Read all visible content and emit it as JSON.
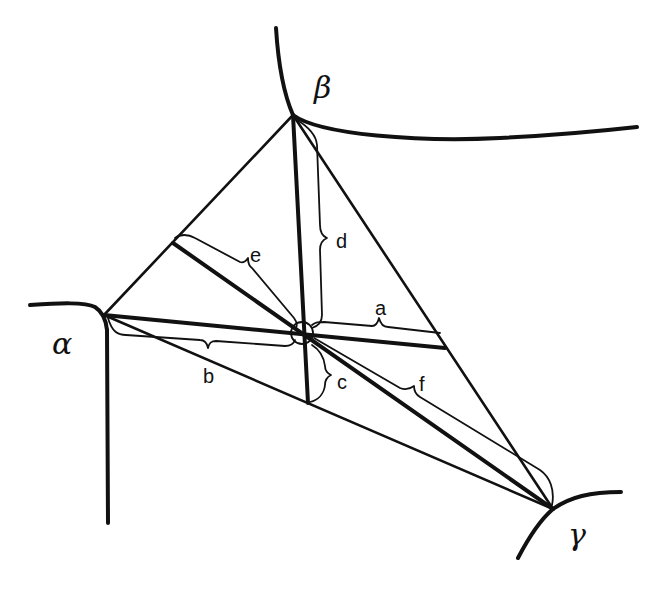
{
  "diagram": {
    "type": "triple-junction geometry",
    "vertices": {
      "alpha": {
        "symbol": "α",
        "x": 104,
        "y": 315
      },
      "beta": {
        "symbol": "β",
        "x": 293,
        "y": 115
      },
      "gamma": {
        "symbol": "γ",
        "x": 553,
        "y": 509
      }
    },
    "center": {
      "x": 302,
      "y": 333
    },
    "labels": {
      "alpha": "α",
      "beta": "β",
      "gamma": "γ",
      "a": "a",
      "b": "b",
      "c": "c",
      "d": "d",
      "e": "e",
      "f": "f"
    },
    "distance_labels": [
      {
        "id": "a",
        "meaning": "center to βγ side along α-median"
      },
      {
        "id": "b",
        "meaning": "α to center"
      },
      {
        "id": "c",
        "meaning": "center to αγ side along β-median"
      },
      {
        "id": "d",
        "meaning": "β to center"
      },
      {
        "id": "e",
        "meaning": "center to αβ side along γ-median"
      },
      {
        "id": "f",
        "meaning": "γ to center"
      }
    ],
    "stroke_color": "#111111",
    "background": "#ffffff"
  }
}
